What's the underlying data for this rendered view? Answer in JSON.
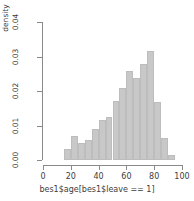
{
  "chart_data": {
    "type": "bar",
    "title": "",
    "xlabel": "bes1$age[bes1$leave == 1]",
    "ylabel": "density",
    "xlim": [
      0,
      100
    ],
    "ylim": [
      0,
      0.04
    ],
    "grid": false,
    "legend": null,
    "bin_width": 5,
    "bar_color": "#c8c8c8",
    "axis_color": "#8a8a8a",
    "xticks": [
      0,
      20,
      40,
      60,
      80,
      100
    ],
    "xtick_labels": [
      "0",
      "20",
      "40",
      "60",
      "80",
      "100"
    ],
    "yticks": [
      0.0,
      0.01,
      0.02,
      0.03,
      0.04
    ],
    "ytick_labels": [
      "0.00",
      "0.01",
      "0.02",
      "0.03",
      "0.04"
    ],
    "bins": [
      {
        "x0": 15,
        "x1": 20,
        "value": 0.0032
      },
      {
        "x0": 20,
        "x1": 25,
        "value": 0.0069
      },
      {
        "x0": 25,
        "x1": 30,
        "value": 0.005
      },
      {
        "x0": 30,
        "x1": 35,
        "value": 0.0058
      },
      {
        "x0": 35,
        "x1": 40,
        "value": 0.0089
      },
      {
        "x0": 40,
        "x1": 45,
        "value": 0.0115
      },
      {
        "x0": 45,
        "x1": 50,
        "value": 0.0126
      },
      {
        "x0": 50,
        "x1": 55,
        "value": 0.017
      },
      {
        "x0": 55,
        "x1": 60,
        "value": 0.021
      },
      {
        "x0": 60,
        "x1": 65,
        "value": 0.0259
      },
      {
        "x0": 65,
        "x1": 70,
        "value": 0.0239
      },
      {
        "x0": 70,
        "x1": 75,
        "value": 0.0277
      },
      {
        "x0": 75,
        "x1": 80,
        "value": 0.0316
      },
      {
        "x0": 80,
        "x1": 85,
        "value": 0.0167
      },
      {
        "x0": 85,
        "x1": 90,
        "value": 0.0065
      },
      {
        "x0": 90,
        "x1": 95,
        "value": 0.0014
      }
    ],
    "categories": [
      "15-20",
      "20-25",
      "25-30",
      "30-35",
      "35-40",
      "40-45",
      "45-50",
      "50-55",
      "55-60",
      "60-65",
      "65-70",
      "70-75",
      "75-80",
      "80-85",
      "85-90",
      "90-95"
    ],
    "values": [
      0.0032,
      0.0069,
      0.005,
      0.0058,
      0.0089,
      0.0115,
      0.0126,
      0.017,
      0.021,
      0.0259,
      0.0239,
      0.0277,
      0.0316,
      0.0167,
      0.0065,
      0.0014
    ]
  }
}
